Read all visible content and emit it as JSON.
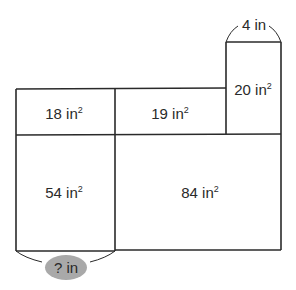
{
  "diagram": {
    "type": "area model",
    "unit": "in",
    "regions": [
      {
        "id": "top-left",
        "area": "18",
        "unit": "in",
        "exp": "2"
      },
      {
        "id": "top-middle",
        "area": "19",
        "unit": "in",
        "exp": "2"
      },
      {
        "id": "tall-right",
        "area": "20",
        "unit": "in",
        "exp": "2"
      },
      {
        "id": "bottom-left",
        "area": "54",
        "unit": "in",
        "exp": "2"
      },
      {
        "id": "bottom-right",
        "area": "84",
        "unit": "in",
        "exp": "2"
      }
    ],
    "dimensions": {
      "top_width": "4 in",
      "unknown_width": "? in"
    },
    "colors": {
      "lines": "#2a2a2a",
      "unknown_highlight": "#a9a9a9"
    }
  }
}
